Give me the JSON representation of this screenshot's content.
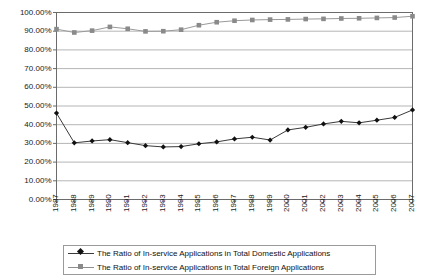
{
  "chart_data": {
    "type": "line",
    "title": "",
    "xlabel": "",
    "ylabel": "",
    "grid": true,
    "legend_position": "bottom",
    "ylim": [
      0,
      1.0
    ],
    "y_tick_labels": [
      "100.00%",
      "90.00%",
      "80.00%",
      "70.00%",
      "60.00%",
      "50.00%",
      "40.00%",
      "30.00%",
      "20.00%",
      "10.00%",
      "0.00%"
    ],
    "y_tick_values": [
      1.0,
      0.9,
      0.8,
      0.7,
      0.6,
      0.5,
      0.4,
      0.3,
      0.2,
      0.1,
      0.0
    ],
    "categories": [
      "1987",
      "1988",
      "1989",
      "1990",
      "1991",
      "1992",
      "1993",
      "1994",
      "1995",
      "1996",
      "1997",
      "1998",
      "1999",
      "2000",
      "2001",
      "2002",
      "2003",
      "2004",
      "2005",
      "2006",
      "2007"
    ],
    "series": [
      {
        "name": "The Ratio of In-service Applications in Total Domestic Applications",
        "marker": "diamond",
        "color": "#111111",
        "line_color": "#3a3a3a",
        "values": [
          0.462,
          0.303,
          0.313,
          0.32,
          0.304,
          0.288,
          0.281,
          0.283,
          0.298,
          0.308,
          0.324,
          0.333,
          0.318,
          0.372,
          0.386,
          0.404,
          0.418,
          0.41,
          0.424,
          0.439,
          0.479
        ]
      },
      {
        "name": "The Ratio of In-service Applications in Total Foreign Applications",
        "marker": "square",
        "color": "#8a8a8a",
        "line_color": "#9a9a9a",
        "values": [
          0.911,
          0.893,
          0.903,
          0.923,
          0.913,
          0.899,
          0.9,
          0.908,
          0.932,
          0.948,
          0.956,
          0.96,
          0.962,
          0.963,
          0.965,
          0.966,
          0.968,
          0.969,
          0.971,
          0.973,
          0.98
        ]
      }
    ]
  },
  "legend": {
    "items": [
      {
        "label": "The Ratio of In-service Applications in Total Domestic Applications",
        "marker": "diamond"
      },
      {
        "label": "The Ratio of In-service Applications in Total Foreign Applications",
        "marker": "square"
      }
    ]
  },
  "colors": {
    "plot_border": "#6b6b6b",
    "gridline": "#b5b5b5",
    "domestic": "#111111",
    "foreign": "#8a8a8a",
    "background": "#ffffff"
  }
}
